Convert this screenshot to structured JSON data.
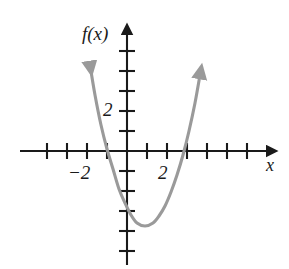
{
  "chart_data": {
    "type": "line",
    "title": "",
    "subtitle": "",
    "xlabel": "x",
    "ylabel": "f(x)",
    "xlim": [
      -4.9,
      7.2
    ],
    "ylim": [
      -5.8,
      6.3
    ],
    "grid": false,
    "legend": null,
    "x_tick_labels": [
      {
        "value": -2,
        "text": "−2"
      },
      {
        "value": 2,
        "text": "2"
      }
    ],
    "y_tick_labels": [
      {
        "value": 2,
        "text": "2"
      }
    ],
    "x_tick_values": [
      -4,
      -3,
      -2,
      -1,
      1,
      2,
      3,
      4,
      5,
      6
    ],
    "y_tick_values": [
      -5,
      -4,
      -3,
      -2,
      -1,
      1,
      2,
      3,
      4,
      5
    ],
    "series": [
      {
        "name": "f(x)",
        "color": "#9a9a9a",
        "shape": "parabola",
        "arrow_start": true,
        "arrow_end": true,
        "vertex": [
          0.9,
          -3.75
        ],
        "y_intercept": -3.1,
        "x_intercepts": [
          -0.9,
          2.7
        ],
        "leading_coefficient": 1.04,
        "x": [
          -1.85,
          -1.6,
          -1.3,
          -1.0,
          -0.7,
          -0.4,
          -0.1,
          0.2,
          0.5,
          0.9,
          1.3,
          1.6,
          1.9,
          2.2,
          2.5,
          2.8,
          3.1,
          3.4,
          3.65
        ],
        "y": [
          4.3,
          2.8,
          1.3,
          0.1,
          -0.9,
          -1.9,
          -2.6,
          -3.2,
          -3.6,
          -3.75,
          -3.6,
          -3.25,
          -2.75,
          -2.05,
          -1.2,
          -0.2,
          1.0,
          2.4,
          3.8
        ]
      }
    ]
  },
  "axes": {
    "x_axis_name": "horizontal-axis",
    "y_axis_name": "vertical-axis",
    "x_label_text": "x",
    "y_label_text": "f(x)",
    "axis_color": "#1a1a1a"
  },
  "colors": {
    "curve": "#9a9a9a",
    "axis": "#1a1a1a",
    "background": "#ffffff"
  }
}
